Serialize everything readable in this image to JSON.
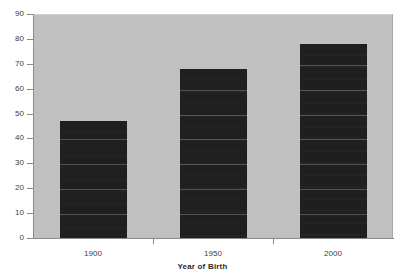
{
  "chart_data": {
    "type": "bar",
    "title": "",
    "subtitle": "",
    "xlabel": "Year of Birth",
    "ylabel": "",
    "categories": [
      "1900",
      "1950",
      "2000"
    ],
    "values": [
      47,
      68,
      78
    ],
    "series": [
      {
        "name": "",
        "values": [
          47,
          68,
          78
        ]
      }
    ],
    "ylim": [
      0,
      90
    ],
    "ytick_labels": [
      "0",
      "10",
      "20",
      "30",
      "40",
      "50",
      "60",
      "70",
      "80",
      "90"
    ],
    "ytick_values": [
      0,
      10,
      20,
      30,
      40,
      50,
      60,
      70,
      80,
      90
    ],
    "grid": true,
    "legend": false,
    "legend_position": "none",
    "annotations": []
  },
  "style": {
    "plot_background": "#c0c0c0",
    "figure_background": "#ffffff",
    "bar_color": "#1f1f1f",
    "axis_color": "#8a8a8a",
    "text_color": "#3c3c3c",
    "gridline_color": "#c8c8c8"
  }
}
